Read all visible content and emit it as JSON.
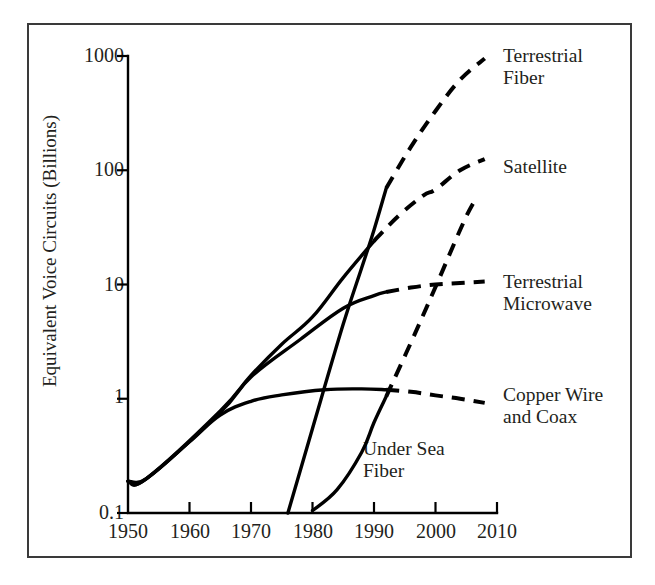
{
  "figure": {
    "title": "",
    "background": "#ffffff",
    "frame_color": "#3a3a3a",
    "line_color": "#000000"
  },
  "axes": {
    "y_axis_title": "Equivalent Voice Circuits (Billions)",
    "x_axis_title": "",
    "y_scale": "log",
    "y_ticks": [
      "1000",
      "100",
      "10",
      "1",
      "0.1"
    ],
    "x_ticks": [
      "1950",
      "1960",
      "1970",
      "1980",
      "1990",
      "2000",
      "2010"
    ]
  },
  "series_labels": {
    "terrestrial_fiber": "Terrestrial\nFiber",
    "satellite": "Satellite",
    "terrestrial_microwave": "Terrestrial\nMicrowave",
    "copper_wire": "Copper Wire\nand Coax",
    "under_sea_fiber": "Under Sea\nFiber"
  },
  "chart_data": {
    "type": "line",
    "title": "",
    "xlabel": "",
    "ylabel": "Equivalent Voice Circuits (Billions)",
    "yscale": "log",
    "ylim": [
      0.1,
      1000
    ],
    "xlim": [
      1950,
      2010
    ],
    "grid": false,
    "legend_position": "right-inline-annotations",
    "y_tick_values": [
      0.1,
      1,
      10,
      100,
      1000
    ],
    "x_tick_values": [
      1950,
      1960,
      1970,
      1980,
      1990,
      2000,
      2010
    ],
    "series": [
      {
        "name": "Terrestrial Fiber",
        "style_historical": "solid",
        "style_projected": "dashed",
        "historical": {
          "x": [
            1976,
            1980,
            1985,
            1988,
            1990,
            1992
          ],
          "y": [
            0.1,
            0.55,
            4.5,
            14,
            30,
            70
          ]
        },
        "projected": {
          "x": [
            1992,
            1996,
            2000,
            2004,
            2008
          ],
          "y": [
            70,
            160,
            330,
            620,
            950
          ]
        }
      },
      {
        "name": "Satellite",
        "style_historical": "solid",
        "style_projected": "dashed",
        "historical": {
          "x": [
            1950,
            1953,
            1965,
            1970,
            1975,
            1980,
            1985,
            1990
          ],
          "y": [
            0.19,
            0.2,
            0.78,
            1.6,
            3.0,
            5.2,
            11.5,
            24
          ]
        },
        "projected": {
          "x": [
            1990,
            1994,
            1998,
            2000,
            2004,
            2008
          ],
          "y": [
            24,
            40,
            60,
            68,
            100,
            125
          ]
        }
      },
      {
        "name": "Terrestrial Microwave",
        "style_historical": "solid",
        "style_projected": "dashed",
        "historical": {
          "x": [
            1950,
            1953,
            1965,
            1970,
            1978,
            1985,
            1990,
            1992
          ],
          "y": [
            0.19,
            0.2,
            0.76,
            1.55,
            3.3,
            6.2,
            8.0,
            8.6
          ]
        },
        "projected": {
          "x": [
            1992,
            1996,
            2000,
            2004,
            2008
          ],
          "y": [
            8.6,
            9.4,
            10.0,
            10.3,
            10.6
          ]
        }
      },
      {
        "name": "Copper Wire and Coax",
        "style_historical": "solid",
        "style_projected": "dashed",
        "historical": {
          "x": [
            1950,
            1953,
            1960,
            1965,
            1970,
            1975,
            1982,
            1988,
            1992
          ],
          "y": [
            0.19,
            0.2,
            0.42,
            0.72,
            0.95,
            1.08,
            1.2,
            1.22,
            1.2
          ]
        },
        "projected": {
          "x": [
            1992,
            1996,
            2000,
            2004,
            2008
          ],
          "y": [
            1.2,
            1.15,
            1.07,
            1.0,
            0.92
          ]
        }
      },
      {
        "name": "Under Sea Fiber",
        "style_historical": "solid",
        "style_projected": "dashed",
        "historical": {
          "x": [
            1980,
            1984,
            1988,
            1990,
            1992
          ],
          "y": [
            0.105,
            0.16,
            0.34,
            0.62,
            1.05
          ]
        },
        "projected": {
          "x": [
            1992,
            1996,
            2000,
            2004,
            2006,
            2007
          ],
          "y": [
            1.05,
            3.1,
            9.5,
            30,
            50,
            57
          ]
        }
      }
    ]
  }
}
